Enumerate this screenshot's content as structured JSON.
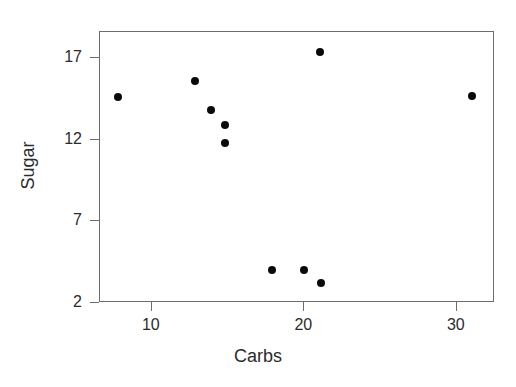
{
  "chart_data": {
    "type": "scatter",
    "title": "",
    "xlabel": "Carbs",
    "ylabel": "Sugar",
    "xlim": [
      6.6,
      32.5
    ],
    "ylim": [
      2,
      18.6
    ],
    "xticks": [
      10,
      20,
      30
    ],
    "xticklabels": [
      "10",
      "20",
      "30"
    ],
    "yticks": [
      2,
      7,
      12,
      17
    ],
    "yticklabels": [
      "2",
      "7",
      "12",
      "17"
    ],
    "grid": false,
    "legend": null,
    "marker": "filled-circle",
    "marker_color": "#0a0a0a",
    "axis_color": "#6d6d6d",
    "background": "#ffffff",
    "x": [
      7.8,
      12.8,
      13.9,
      14.8,
      14.8,
      17.9,
      20.0,
      21.0,
      21.1,
      31.0
    ],
    "y": [
      14.6,
      15.6,
      13.8,
      12.9,
      11.8,
      4.0,
      4.0,
      17.4,
      3.2,
      14.7
    ],
    "points": [
      {
        "x": 7.8,
        "y": 14.6
      },
      {
        "x": 12.8,
        "y": 15.6
      },
      {
        "x": 13.9,
        "y": 13.8
      },
      {
        "x": 14.8,
        "y": 12.9
      },
      {
        "x": 14.8,
        "y": 11.8
      },
      {
        "x": 17.9,
        "y": 4.0
      },
      {
        "x": 20.0,
        "y": 4.0
      },
      {
        "x": 21.0,
        "y": 17.4
      },
      {
        "x": 21.1,
        "y": 3.2
      },
      {
        "x": 31.0,
        "y": 14.7
      }
    ]
  }
}
